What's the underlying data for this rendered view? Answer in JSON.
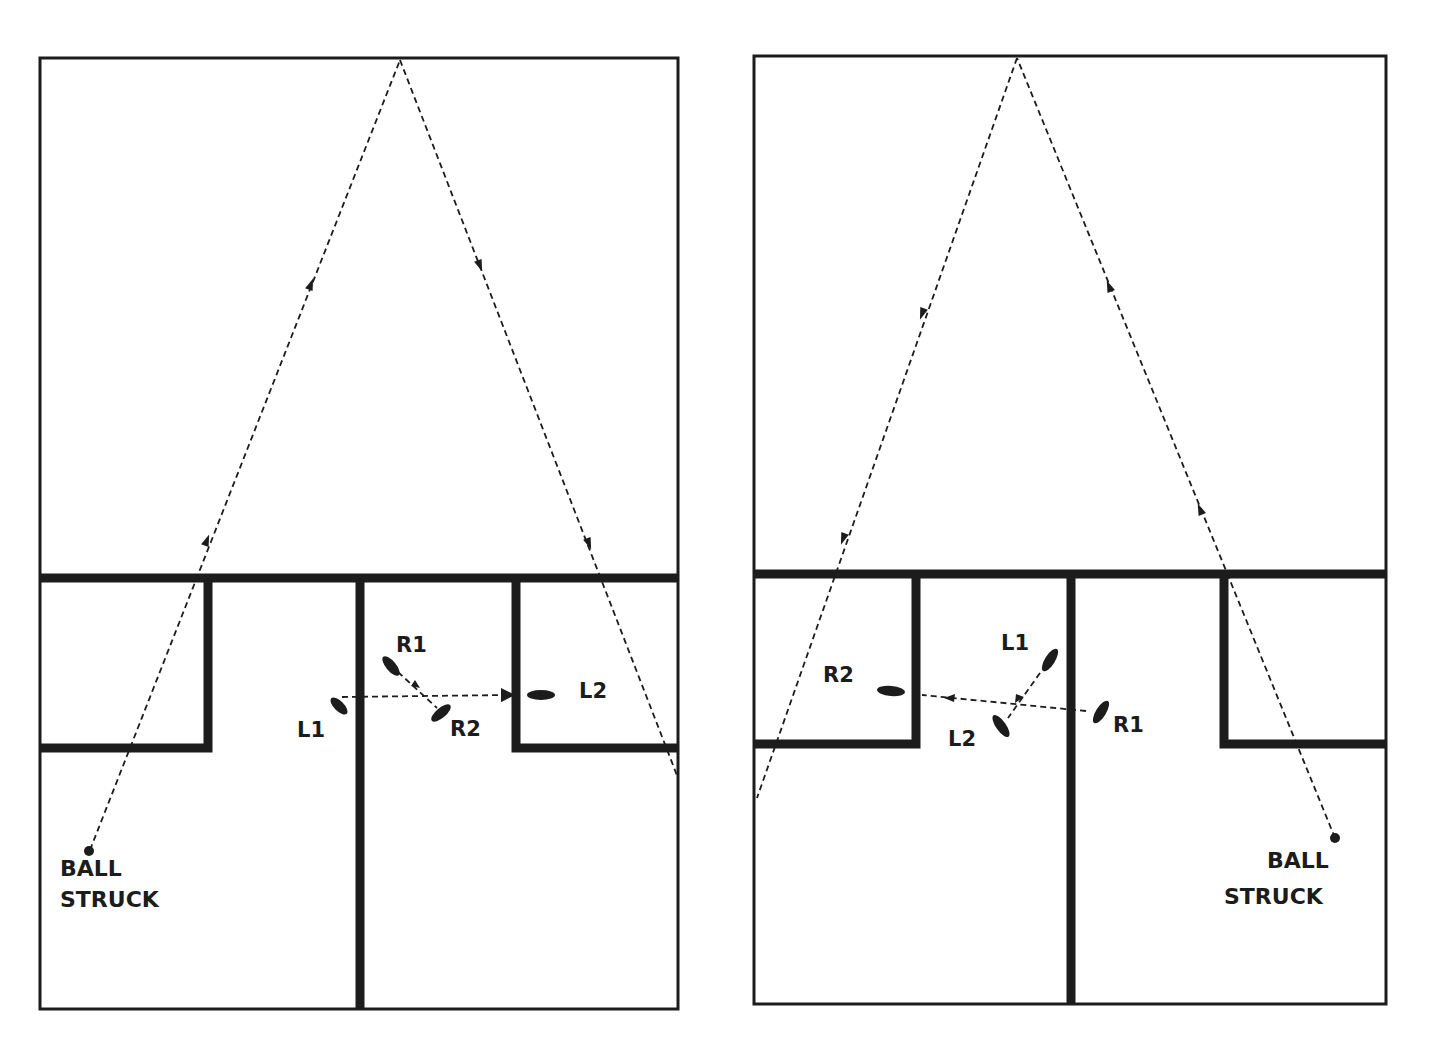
{
  "colors": {
    "line": "#1c1c1c",
    "background": "#ffffff"
  },
  "left_court": {
    "ball_label_line1": "BALL",
    "ball_label_line2": "STRUCK",
    "footsteps": [
      {
        "id": "R1",
        "label": "R1"
      },
      {
        "id": "R2",
        "label": "R2"
      },
      {
        "id": "L1",
        "label": "L1"
      },
      {
        "id": "L2",
        "label": "L2"
      }
    ]
  },
  "right_court": {
    "ball_label_line1": "BALL",
    "ball_label_line2": "STRUCK",
    "footsteps": [
      {
        "id": "L1",
        "label": "L1"
      },
      {
        "id": "L2",
        "label": "L2"
      },
      {
        "id": "R1",
        "label": "R1"
      },
      {
        "id": "R2",
        "label": "R2"
      }
    ]
  },
  "icons": {
    "footprint": "footprint-icon",
    "ball": "ball-dot-icon",
    "arrow": "arrowhead-icon"
  }
}
